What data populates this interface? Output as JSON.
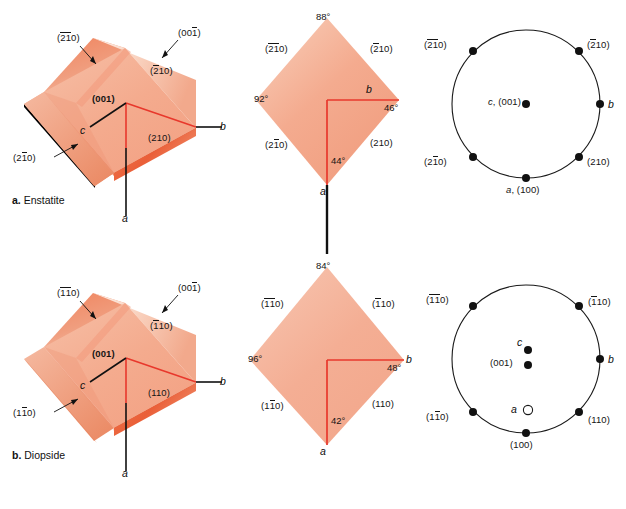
{
  "figure": {
    "background": "#ffffff",
    "crystal_fill_light": "#f7c3ac",
    "crystal_fill_mid": "#f3a183",
    "crystal_fill_dark": "#ec6a44",
    "crystal_fill_pale": "#fbe0d4",
    "axis_red": "#e8382c",
    "axis_black": "#111111",
    "stereo_line": "#1a1a1a"
  },
  "rows": [
    {
      "id": "enstatite",
      "caption_prefix": "a.",
      "caption_name": "Enstatite",
      "crystal_3d": {
        "labels": {
          "top_left_face": {
            "pre": "(",
            "bar1": "2",
            "bar2": "1",
            "post": "0)"
          },
          "top_right_face": {
            "pre": "(00",
            "bar1": "1",
            "post": ")"
          },
          "front_right_face": {
            "pre": "(",
            "bar1": "2",
            "post": "10)"
          },
          "basal": "(001)",
          "lower_left_face": {
            "pre": "(2",
            "bar1": "1",
            "post": "0)"
          },
          "lower_right_face": "(210)"
        },
        "axes": {
          "a": "a",
          "b": "b",
          "c": "c"
        }
      },
      "projection": {
        "angles": {
          "top": "88°",
          "left": "92°",
          "right": "46°",
          "bottom": "44°"
        },
        "faces": {
          "upper_left": {
            "pre": "(",
            "bar1": "2",
            "bar2": "1",
            "post": "0)"
          },
          "upper_right": {
            "pre": "(",
            "bar1": "2",
            "post": "10)"
          },
          "lower_left": {
            "pre": "(2",
            "bar1": "1",
            "post": "0)"
          },
          "lower_right": "(210)"
        },
        "axes": {
          "a": "a",
          "b": "b"
        }
      },
      "stereonet": {
        "center_label": {
          "italic": "c",
          "plain": ", (001)"
        },
        "right_label": "b",
        "bottom_label": {
          "italic": "a",
          "plain": ", (100)"
        },
        "rim_labels": {
          "upper_left": {
            "pre": "(",
            "bar1": "2",
            "bar2": "1",
            "post": "0)"
          },
          "upper_right": {
            "pre": "(",
            "bar1": "2",
            "post": "10)"
          },
          "lower_left": {
            "pre": "(2",
            "bar1": "1",
            "post": "0)"
          },
          "lower_right": "(210)"
        },
        "open_circle": false
      }
    },
    {
      "id": "diopside",
      "caption_prefix": "b.",
      "caption_name": "Diopside",
      "crystal_3d": {
        "labels": {
          "top_left_face": {
            "pre": "(",
            "bar1": "1",
            "bar2": "1",
            "post": "0)"
          },
          "top_right_face": {
            "pre": "(00",
            "bar1": "1",
            "post": ")"
          },
          "front_right_face": {
            "pre": "(",
            "bar1": "1",
            "post": "10)"
          },
          "basal": "(001)",
          "lower_left_face": {
            "pre": "(1",
            "bar1": "1",
            "post": "0)"
          },
          "lower_right_face": "(110)"
        },
        "axes": {
          "a": "a",
          "b": "b",
          "c": "c"
        }
      },
      "projection": {
        "angles": {
          "top": "84°",
          "left": "96°",
          "right": "48°",
          "bottom": "42°"
        },
        "faces": {
          "upper_left": {
            "pre": "(",
            "bar1": "1",
            "bar2": "1",
            "post": "0)"
          },
          "upper_right": {
            "pre": "(",
            "bar1": "1",
            "post": "10)"
          },
          "lower_left": {
            "pre": "(1",
            "bar1": "1",
            "post": "0)"
          },
          "lower_right": "(110)"
        },
        "axes": {
          "a": "a",
          "b": "b"
        }
      },
      "stereonet": {
        "center_c": "c",
        "center_001": "(001)",
        "right_label": "b",
        "open_label": "a",
        "bottom_label": "(100)",
        "rim_labels": {
          "upper_left": {
            "pre": "(",
            "bar1": "1",
            "bar2": "1",
            "post": "0)"
          },
          "upper_right": {
            "pre": "(",
            "bar1": "1",
            "post": "10)"
          },
          "lower_left": {
            "pre": "(1",
            "bar1": "1",
            "post": "0)"
          },
          "lower_right": "(110)"
        },
        "open_circle": true
      }
    }
  ]
}
